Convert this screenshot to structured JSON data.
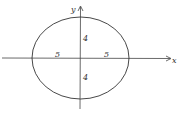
{
  "diagram": {
    "type": "ellipse-on-axes",
    "axes": {
      "x_label": "x",
      "y_label": "y"
    },
    "ellipse": {
      "center": [
        0,
        0
      ],
      "semi_major_label_left": "5",
      "semi_major_label_right": "5",
      "semi_minor_label_top": "4",
      "semi_minor_label_bottom": "4"
    },
    "colors": {
      "stroke": "#333333",
      "background": "#ffffff"
    }
  }
}
